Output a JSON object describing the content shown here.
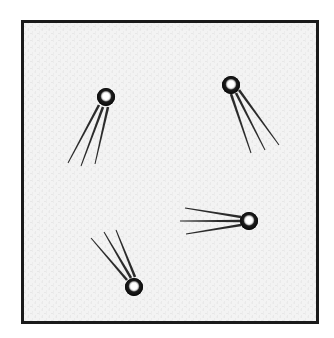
{
  "figure": {
    "canvas": {
      "width": 334,
      "height": 338
    },
    "page_background": "#ffffff",
    "frame": {
      "name": "square-border-frame",
      "x": 21,
      "y": 20,
      "width": 298,
      "height": 304,
      "stroke_color": "#1a1a1a",
      "stroke_width": 3,
      "fill_color": "#f2f2f2"
    },
    "paper_texture": {
      "visible": true,
      "tone": "#f2f2f2",
      "speckle_color": "#e6e6e6"
    },
    "comets": [
      {
        "id": "comet-top-left",
        "label": "Comet pointing up-right",
        "head": {
          "cx": 106,
          "cy": 97,
          "r": 9
        },
        "head_fill": "#111111",
        "head_highlight": "#ffffff",
        "head_highlight_r": 3.4,
        "tails": [
          {
            "x1": 99,
            "y1": 105,
            "x2": 68,
            "y2": 163,
            "w1": 2.6,
            "w2": 1.0
          },
          {
            "x1": 103,
            "y1": 107,
            "x2": 81,
            "y2": 166,
            "w1": 2.6,
            "w2": 1.0
          },
          {
            "x1": 108,
            "y1": 107,
            "x2": 95,
            "y2": 164,
            "w1": 2.6,
            "w2": 1.0
          }
        ]
      },
      {
        "id": "comet-top-right",
        "label": "Comet pointing up-left",
        "head": {
          "cx": 231,
          "cy": 85,
          "r": 9
        },
        "head_fill": "#111111",
        "head_highlight": "#ffffff",
        "head_highlight_r": 3.4,
        "tails": [
          {
            "x1": 231,
            "y1": 94,
            "x2": 251,
            "y2": 153,
            "w1": 2.6,
            "w2": 1.0
          },
          {
            "x1": 236,
            "y1": 93,
            "x2": 265,
            "y2": 150,
            "w1": 2.6,
            "w2": 1.0
          },
          {
            "x1": 239,
            "y1": 90,
            "x2": 279,
            "y2": 145,
            "w1": 2.6,
            "w2": 1.0
          }
        ]
      },
      {
        "id": "comet-middle-right",
        "label": "Comet pointing right",
        "head": {
          "cx": 249,
          "cy": 221,
          "r": 9
        },
        "head_fill": "#111111",
        "head_highlight": "#ffffff",
        "head_highlight_r": 3.4,
        "tails": [
          {
            "x1": 241,
            "y1": 217,
            "x2": 185,
            "y2": 208,
            "w1": 2.6,
            "w2": 1.0
          },
          {
            "x1": 240,
            "y1": 221,
            "x2": 180,
            "y2": 221,
            "w1": 2.6,
            "w2": 1.0
          },
          {
            "x1": 241,
            "y1": 225,
            "x2": 186,
            "y2": 234,
            "w1": 2.6,
            "w2": 1.0
          }
        ]
      },
      {
        "id": "comet-bottom-left",
        "label": "Comet pointing down-right",
        "head": {
          "cx": 134,
          "cy": 287,
          "r": 9
        },
        "head_fill": "#111111",
        "head_highlight": "#ffffff",
        "head_highlight_r": 3.4,
        "tails": [
          {
            "x1": 127,
            "y1": 280,
            "x2": 91,
            "y2": 238,
            "w1": 2.6,
            "w2": 1.0
          },
          {
            "x1": 131,
            "y1": 278,
            "x2": 104,
            "y2": 232,
            "w1": 2.6,
            "w2": 1.0
          },
          {
            "x1": 135,
            "y1": 277,
            "x2": 116,
            "y2": 230,
            "w1": 2.6,
            "w2": 1.0
          }
        ]
      }
    ]
  }
}
